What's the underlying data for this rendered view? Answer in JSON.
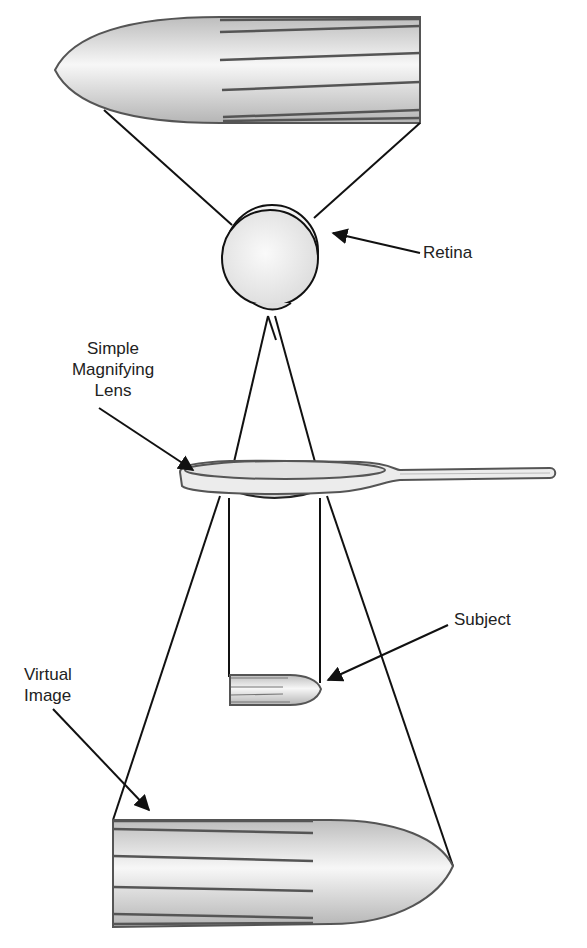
{
  "diagram": {
    "labels": {
      "retina": "Retina",
      "lens_line1": "Simple",
      "lens_line2": "Magnifying",
      "lens_line3": "Lens",
      "subject": "Subject",
      "virtual_line1": "Virtual",
      "virtual_line2": "Image"
    },
    "colors": {
      "stroke": "#1a1a1a",
      "object_outline": "#555555",
      "fill_light": "#f4f4f4",
      "fill_dark": "#c8c8c8"
    }
  }
}
